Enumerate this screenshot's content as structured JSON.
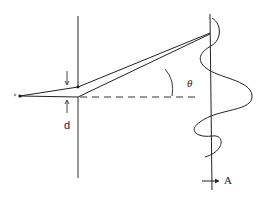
{
  "diagram": {
    "type": "double-slit interference",
    "labels": {
      "angle": "θ",
      "slit_separation": "d",
      "point": "A"
    },
    "colors": {
      "stroke": "#222222",
      "background": "#ffffff"
    }
  }
}
